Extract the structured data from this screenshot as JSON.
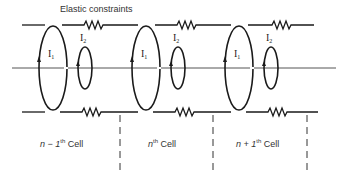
{
  "diagram": {
    "title_label": "Elastic constraints",
    "colors": {
      "stroke": "#1a1a1a",
      "axis": "#555555",
      "background": "#ffffff"
    },
    "loops": {
      "large_label": "I",
      "large_sub": "1",
      "small_label": "I",
      "small_sub": "2"
    },
    "cells": [
      {
        "prefix": "n − 1",
        "sup": "th",
        "suffix": " Cell"
      },
      {
        "prefix": "n",
        "sup": "th",
        "suffix": " Cell"
      },
      {
        "prefix": "n + 1",
        "sup": "th",
        "suffix": " Cell"
      }
    ]
  }
}
